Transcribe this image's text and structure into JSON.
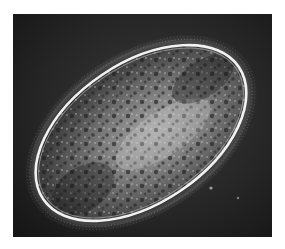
{
  "image": {
    "subject": "Ciliate micrograph (phase contrast)",
    "background_color": "#ffffff",
    "field_color": "#1c1c1c",
    "cell_fill": "#6e6e6e",
    "rim_color": "#f2f2f2"
  }
}
